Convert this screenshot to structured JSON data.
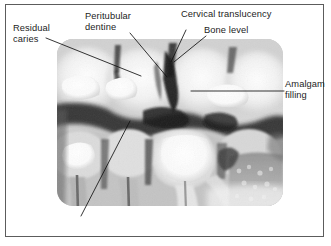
{
  "figure": {
    "type": "annotated-dental-bitewing-radiograph",
    "border_color": "#5c5c5c",
    "background_color": "#ffffff",
    "text_color": "#1c1c1c"
  },
  "labels": {
    "residual_caries": "Residual\ncaries",
    "peritubular_dentine": "Peritubular\ndentine",
    "cervical_translucency": "Cervical translucency",
    "bone_level": "Bone level",
    "amalgam_filling": "Amalgam\nfilling"
  },
  "leaders": [
    {
      "name": "residual-caries-leader",
      "from": [
        46,
        38
      ],
      "to": [
        141,
        76
      ]
    },
    {
      "name": "peritubular-dentine-leader",
      "from": [
        130,
        33
      ],
      "to": [
        167,
        77
      ]
    },
    {
      "name": "cervical-translucency-leader",
      "from": [
        186,
        30
      ],
      "to": [
        171,
        62
      ]
    },
    {
      "name": "bone-level-leader",
      "from": [
        206,
        36
      ],
      "to": [
        174,
        62
      ]
    },
    {
      "name": "amalgam-filling-leader",
      "from": [
        191,
        91
      ],
      "to": [
        284,
        91
      ]
    },
    {
      "name": "unlabelled-lower-leader",
      "from": [
        130,
        121
      ],
      "to": [
        81,
        216
      ]
    }
  ],
  "radiograph": {
    "name": "bitewing-radiograph",
    "region": {
      "x": 57,
      "y": 39,
      "width": 226,
      "height": 167
    },
    "corner_radius": 16,
    "description": "Grayscale posterior bitewing dental radiograph showing upper and lower molars and premolars with radiopaque amalgam restorations, interproximal caries, pulp chambers, roots and alveolar bone level."
  }
}
